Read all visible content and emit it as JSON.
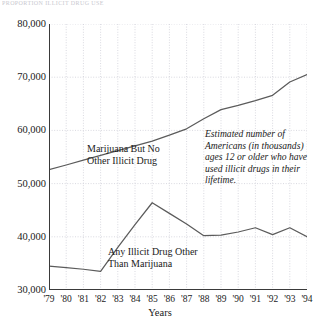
{
  "figure": {
    "top_caption_fragment": "PROPORTION ILLICIT DRUG USE",
    "xaxis_title": "Years"
  },
  "annotations": {
    "marijuana_label": "Marijuana But No\nOther Illicit Drug",
    "other_label": "Any Illicit Drug Other\nThan Marijuana",
    "note": "Estimated number of Americans (in thousands) ages 12 or older who have used illicit drugs in their lifetime."
  },
  "chart_data": {
    "type": "line",
    "title": "",
    "subtitle": "",
    "xlabel": "Years",
    "ylabel": "",
    "xlim": [
      1979,
      1994
    ],
    "ylim": [
      30000,
      80000
    ],
    "yticks": [
      30000,
      40000,
      50000,
      60000,
      70000,
      80000
    ],
    "ytick_labels": [
      "30,000",
      "40,000",
      "50,000",
      "60,000",
      "70,000",
      "80,000"
    ],
    "x": [
      1979,
      1980,
      1981,
      1982,
      1983,
      1984,
      1985,
      1986,
      1987,
      1988,
      1989,
      1990,
      1991,
      1992,
      1993,
      1994
    ],
    "xtick_labels": [
      "'79",
      "'80",
      "'81",
      "'82",
      "'83",
      "'84",
      "'85",
      "'86",
      "'87",
      "'88",
      "'89",
      "'90",
      "'91",
      "'92",
      "'93",
      "'94"
    ],
    "grid": true,
    "grid_style": "dotted",
    "legend": "inline-annotations",
    "line_color": "#5b5b5b",
    "grid_color": "#c8c8d2",
    "axis_color": "#3a3a3a",
    "series": [
      {
        "name": "Marijuana But No Other Illicit Drug",
        "values": [
          52600,
          53500,
          54400,
          55300,
          56200,
          57100,
          58000,
          59100,
          60300,
          62200,
          63900,
          64700,
          65600,
          66600,
          69100,
          70500
        ]
      },
      {
        "name": "Any Illicit Drug Other Than Marijuana",
        "values": [
          34500,
          34200,
          33900,
          33500,
          38000,
          42300,
          46400,
          44400,
          42400,
          40200,
          40300,
          40900,
          41700,
          40400,
          41700,
          40000
        ]
      }
    ]
  }
}
